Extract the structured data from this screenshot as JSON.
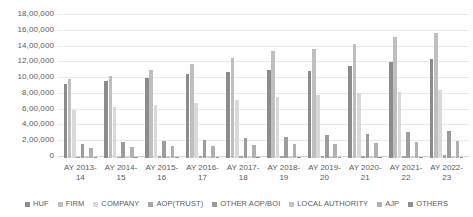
{
  "chart_data": {
    "type": "bar",
    "title": "",
    "xlabel": "",
    "ylabel": "",
    "ylim": [
      0,
      1800000
    ],
    "grid": true,
    "legend_position": "bottom",
    "y_ticks": [
      "0",
      "2,00,000",
      "4,00,000",
      "6,00,000",
      "8,00,000",
      "10,00,000",
      "12,00,000",
      "14,00,000",
      "16,00,000",
      "18,00,000"
    ],
    "y_tick_values": [
      0,
      200000,
      400000,
      600000,
      800000,
      1000000,
      1200000,
      1400000,
      1600000,
      1800000
    ],
    "categories": [
      "AY 2013-14",
      "AY 2014-15",
      "AY 2015-16",
      "AY 2016-17",
      "AY 2017-18",
      "AY 2018-19",
      "AY 2019-20",
      "AY 2020-21",
      "AY 2021-22",
      "AY 2022-23"
    ],
    "category_lines": [
      [
        "AY 2013-",
        "14"
      ],
      [
        "AY 2014-",
        "15"
      ],
      [
        "AY 2015-",
        "16"
      ],
      [
        "AY 2016-",
        "17"
      ],
      [
        "AY 2017-",
        "18"
      ],
      [
        "AY 2018-",
        "19"
      ],
      [
        "AY 2019-",
        "20"
      ],
      [
        "AY 2020-",
        "21"
      ],
      [
        "AY 2021-",
        "22"
      ],
      [
        "AY 2022-",
        "23"
      ]
    ],
    "series": [
      {
        "name": "HUF",
        "color": "#8c8c8c",
        "values": [
          950000,
          990000,
          1030000,
          1080000,
          1110000,
          1130000,
          1120000,
          1180000,
          1230000,
          1270000
        ]
      },
      {
        "name": "FIRM",
        "color": "#bfbfbf",
        "values": [
          1010000,
          1060000,
          1130000,
          1210000,
          1290000,
          1370000,
          1400000,
          1470000,
          1560000,
          1610000
        ]
      },
      {
        "name": "COMPANY",
        "color": "#d9d9d9",
        "values": [
          620000,
          650000,
          680000,
          710000,
          750000,
          790000,
          810000,
          830000,
          850000,
          870000
        ]
      },
      {
        "name": "AOP(TRUST)",
        "color": "#a6a6a6",
        "values": [
          18000,
          19000,
          21000,
          23000,
          25000,
          27000,
          28000,
          30000,
          31000,
          33000
        ]
      },
      {
        "name": "OTHER AOP/BOI",
        "color": "#9c9c9c",
        "values": [
          185000,
          200000,
          215000,
          235000,
          255000,
          275000,
          290000,
          310000,
          330000,
          350000
        ]
      },
      {
        "name": "LOCAL AUTHORITY",
        "color": "#c4c4c4",
        "values": [
          5000,
          5200,
          5400,
          5600,
          5800,
          6000,
          6100,
          6300,
          6500,
          6700
        ]
      },
      {
        "name": "AJP",
        "color": "#b0b0b0",
        "values": [
          130000,
          140000,
          150000,
          160000,
          170000,
          180000,
          185000,
          195000,
          205000,
          215000
        ]
      },
      {
        "name": "OTHERS",
        "color": "#8f8f8f",
        "values": [
          4000,
          4200,
          4400,
          4600,
          4800,
          5000,
          5100,
          5300,
          5500,
          5700
        ]
      }
    ]
  }
}
